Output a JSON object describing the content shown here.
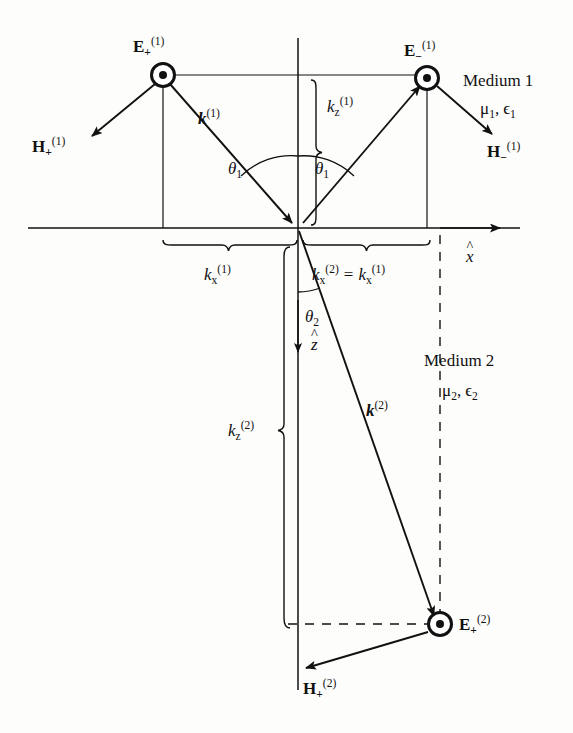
{
  "figure": {
    "stroke_color": "#111111",
    "background": "#fdfdfc"
  },
  "media": {
    "upper": {
      "name": "Medium 1",
      "properties_mu": "μ",
      "properties_mu_sub": "1",
      "properties_eps": "ϵ",
      "properties_eps_sub": "1",
      "properties": "μ₁, ϵ₁"
    },
    "lower": {
      "name": "Medium 2",
      "properties_mu": "μ",
      "properties_mu_sub": "2",
      "properties_eps": "ϵ",
      "properties_eps_sub": "2",
      "properties": "μ₂, ϵ₂"
    }
  },
  "axes": {
    "x_label_base": "x",
    "x_label_hat": "^",
    "z_label_base": "z",
    "z_label_hat": "^"
  },
  "fields": {
    "incident_E": {
      "base": "E",
      "sub": "+",
      "sup": "(1)"
    },
    "incident_H": {
      "base": "H",
      "sub": "+",
      "sup": "(1)"
    },
    "reflected_E": {
      "base": "E",
      "sub": "−",
      "sup": "(1)"
    },
    "reflected_H": {
      "base": "H",
      "sub": "−",
      "sup": "(1)"
    },
    "transmitted_E": {
      "base": "E",
      "sub": "+",
      "sup": "(2)"
    },
    "transmitted_H": {
      "base": "H",
      "sub": "+",
      "sup": "(2)"
    }
  },
  "wavevectors": {
    "incident_k": {
      "base": "k",
      "sup": "(1)"
    },
    "transmitted_k": {
      "base": "k",
      "sup": "(2)"
    },
    "kz1": {
      "base": "k",
      "sub": "z",
      "sup": "(1)"
    },
    "kz2": {
      "base": "k",
      "sub": "z",
      "sup": "(2)"
    },
    "kx1": {
      "base": "k",
      "sub": "x",
      "sup": "(1)"
    },
    "kx_relation_left": {
      "base": "k",
      "sub": "x",
      "sup": "(2)"
    },
    "kx_relation_equals": "=",
    "kx_relation_right": {
      "base": "k",
      "sub": "x",
      "sup": "(1)"
    }
  },
  "angles": {
    "theta1_incident": {
      "base": "θ",
      "sub": "1"
    },
    "theta1_reflected": {
      "base": "θ",
      "sub": "1"
    },
    "theta2": {
      "base": "θ",
      "sub": "2"
    }
  },
  "geometry": {
    "origin_x": 298,
    "origin_y": 228,
    "interface_y": 228,
    "normal_axis_x": 298,
    "incident_node_x": 163,
    "incident_node_y": 75,
    "reflected_node_x": 427,
    "reflected_node_y": 78,
    "transmitted_node_x": 440,
    "transmitted_node_y": 624
  }
}
